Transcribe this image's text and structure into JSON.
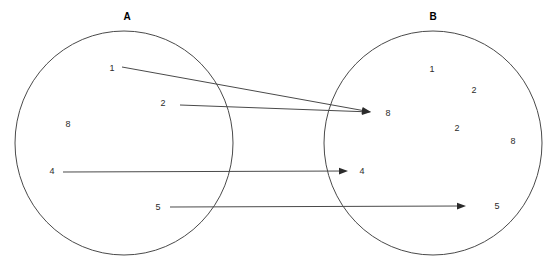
{
  "canvas": {
    "width": 554,
    "height": 273,
    "background": "#ffffff"
  },
  "style": {
    "stroke_color": "#4a4a4a",
    "arrow_color": "#2b2b2b",
    "text_color": "#2b2b2b",
    "title_color": "#000000"
  },
  "sets": [
    {
      "name": "set-a",
      "title": "A",
      "title_x": 127,
      "title_y": 17,
      "cx": 124,
      "cy": 143,
      "rx": 109,
      "ry": 112,
      "members": [
        {
          "label": "1",
          "x": 112,
          "y": 68
        },
        {
          "label": "2",
          "x": 163,
          "y": 103
        },
        {
          "label": "8",
          "x": 68,
          "y": 124
        },
        {
          "label": "4",
          "x": 52,
          "y": 171
        },
        {
          "label": "5",
          "x": 158,
          "y": 207
        }
      ]
    },
    {
      "name": "set-b",
      "title": "B",
      "title_x": 433,
      "title_y": 17,
      "cx": 433,
      "cy": 143,
      "rx": 109,
      "ry": 112,
      "members": [
        {
          "label": "1",
          "x": 432,
          "y": 69
        },
        {
          "label": "2",
          "x": 474,
          "y": 90
        },
        {
          "label": "8",
          "x": 388,
          "y": 113
        },
        {
          "label": "2",
          "x": 457,
          "y": 128
        },
        {
          "label": "8",
          "x": 513,
          "y": 141
        },
        {
          "label": "4",
          "x": 362,
          "y": 171
        },
        {
          "label": "5",
          "x": 497,
          "y": 206
        }
      ]
    }
  ],
  "mappings": [
    {
      "name": "arrow-1-to-8",
      "from": "1",
      "to": "8",
      "x1": 122,
      "y1": 67,
      "x2": 371,
      "y2": 112
    },
    {
      "name": "arrow-2-to-8",
      "from": "2",
      "to": "8",
      "x1": 180,
      "y1": 105,
      "x2": 371,
      "y2": 112
    },
    {
      "name": "arrow-4-to-4",
      "from": "4",
      "to": "4",
      "x1": 63,
      "y1": 172,
      "x2": 348,
      "y2": 171
    },
    {
      "name": "arrow-5-to-5",
      "from": "5",
      "to": "5",
      "x1": 170,
      "y1": 207,
      "x2": 466,
      "y2": 206
    }
  ]
}
